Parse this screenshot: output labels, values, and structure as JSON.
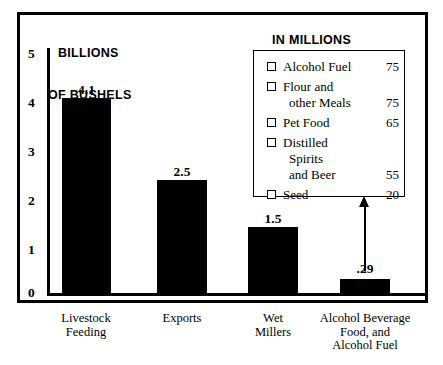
{
  "chart_data": {
    "type": "bar",
    "title": "",
    "ylabel": "BILLIONS OF BUSHELS",
    "xlabel": "",
    "ylim": [
      0,
      5
    ],
    "yticks": [
      "0",
      "1",
      "2",
      "3",
      "4",
      "5"
    ],
    "grid": false,
    "categories": [
      "Livestock\nFeeding",
      "Exports",
      "Wet\nMillers",
      "Alcohol Beverage\nFood, and\nAlcohol Fuel"
    ],
    "values": [
      4.1,
      2.5,
      1.5,
      0.29
    ],
    "value_labels": [
      "4.1",
      "2.5",
      "1.5",
      ".29"
    ],
    "annotation": "Arrow from the .29 bar up to the IN MILLIONS OF BUSHELS breakdown box",
    "breakdown": {
      "title": "IN MILLIONS OF BUSHELS",
      "units": "millions of bushels",
      "categories": [
        "Alcohol Fuel",
        "Flour and other Meals",
        "Pet Food",
        "Distilled Spirits and Beer",
        "Seed"
      ],
      "values": [
        75,
        75,
        65,
        55,
        20
      ]
    }
  },
  "axis_title": {
    "line1": "BILLIONS",
    "line2": "OF BUSHELS"
  },
  "yaxis": {
    "ticks": [
      {
        "label": "5",
        "top": 47
      },
      {
        "label": "4",
        "top": 96
      },
      {
        "label": "3",
        "top": 145
      },
      {
        "label": "2",
        "top": 194
      },
      {
        "label": "1",
        "top": 243
      },
      {
        "label": "0",
        "top": 286
      }
    ]
  },
  "bars": [
    {
      "value_label": "4.1",
      "label": "Livestock\nFeeding",
      "left": 62,
      "width": 49,
      "top": 98,
      "height": 195,
      "label_top": 83,
      "xlabel_left": 36,
      "xlabel_width": 100
    },
    {
      "value_label": "2.5",
      "label": "Exports",
      "left": 157,
      "width": 50,
      "top": 180,
      "height": 113,
      "label_top": 165,
      "xlabel_left": 132,
      "xlabel_width": 100
    },
    {
      "value_label": "1.5",
      "label": "Wet\nMillers",
      "left": 248,
      "width": 50,
      "top": 227,
      "height": 66,
      "label_top": 212,
      "xlabel_left": 223,
      "xlabel_width": 100
    },
    {
      "value_label": ".29",
      "label": "Alcohol Beverage\nFood, and\nAlcohol Fuel",
      "left": 340,
      "width": 50,
      "top": 279,
      "height": 14,
      "label_top": 262,
      "xlabel_left": 305,
      "xlabel_width": 120
    }
  ],
  "legend": {
    "title_line1": "IN MILLIONS",
    "title_line2": "OF BUSHELS",
    "items": [
      {
        "lines": [
          "Alcohol Fuel"
        ],
        "value": "75"
      },
      {
        "lines": [
          "Flour and",
          "other Meals"
        ],
        "value": "75"
      },
      {
        "lines": [
          "Pet Food"
        ],
        "value": "65"
      },
      {
        "lines": [
          "Distilled",
          "Spirits",
          "and Beer"
        ],
        "value": "55"
      },
      {
        "lines": [
          "Seed"
        ],
        "value": "20"
      }
    ]
  }
}
